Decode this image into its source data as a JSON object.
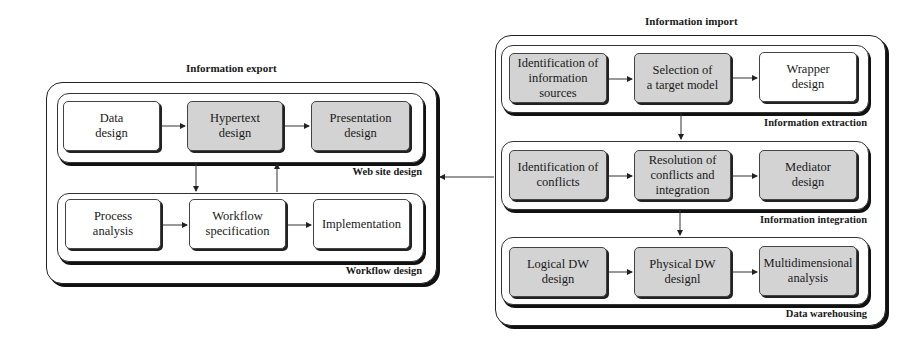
{
  "export": {
    "title": "Information export",
    "web_site_design": {
      "label": "Web site design",
      "nodes": [
        {
          "label": "Data\ndesign",
          "shaded": false
        },
        {
          "label": "Hypertext\ndesign",
          "shaded": true
        },
        {
          "label": "Presentation\ndesign",
          "shaded": true
        }
      ]
    },
    "workflow_design": {
      "label": "Workflow design",
      "nodes": [
        {
          "label": "Process\nanalysis",
          "shaded": false
        },
        {
          "label": "Workflow\nspecification",
          "shaded": false
        },
        {
          "label": "Implementation",
          "shaded": false
        }
      ]
    }
  },
  "import": {
    "title": "Information import",
    "information_extraction": {
      "label": "Information extraction",
      "nodes": [
        {
          "label": "Identification of\ninformation\nsources",
          "shaded": true
        },
        {
          "label": "Selection of\na target model",
          "shaded": true
        },
        {
          "label": "Wrapper\ndesign",
          "shaded": false
        }
      ]
    },
    "information_integration": {
      "label": "Information integration",
      "nodes": [
        {
          "label": "Identification of\nconflicts",
          "shaded": true
        },
        {
          "label": "Resolution of\nconflicts and\nintegration",
          "shaded": true
        },
        {
          "label": "Mediator\ndesign",
          "shaded": true
        }
      ]
    },
    "data_warehousing": {
      "label": "Data warehousing",
      "nodes": [
        {
          "label": "Logical DW\ndesign",
          "shaded": true
        },
        {
          "label": "Physical DW\ndesignl",
          "shaded": true
        },
        {
          "label": "Multidimensional\nanalysis",
          "shaded": true
        }
      ]
    }
  },
  "colors": {
    "shaded_fill": "#d3d3d3",
    "plain_fill": "#ffffff",
    "line": "#222222"
  }
}
